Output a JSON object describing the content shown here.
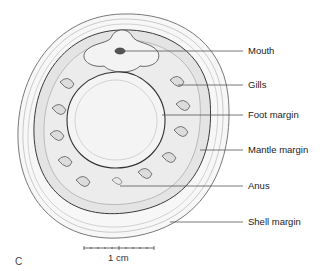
{
  "figure": {
    "panel_label": "C",
    "colors": {
      "background": "#ffffff",
      "line": "#4a4a4a",
      "shell_fill": "#f6f6f6",
      "mantle_fill": "#e2e2e2",
      "foot_fill": "#f2f2f2",
      "text": "#222222"
    },
    "labels": [
      {
        "text": "Mouth",
        "y": 51,
        "line_start_x": 120
      },
      {
        "text": "Gills",
        "y": 85,
        "line_start_x": 178
      },
      {
        "text": "Foot margin",
        "y": 115,
        "line_start_x": 162
      },
      {
        "text": "Mantle margin",
        "y": 150,
        "line_start_x": 200
      },
      {
        "text": "Anus",
        "y": 186,
        "line_start_x": 120
      },
      {
        "text": "Shell margin",
        "y": 222,
        "line_start_x": 170
      }
    ],
    "scale_bar": {
      "label": "1 cm",
      "x1": 84,
      "x2": 154,
      "y": 248
    }
  }
}
